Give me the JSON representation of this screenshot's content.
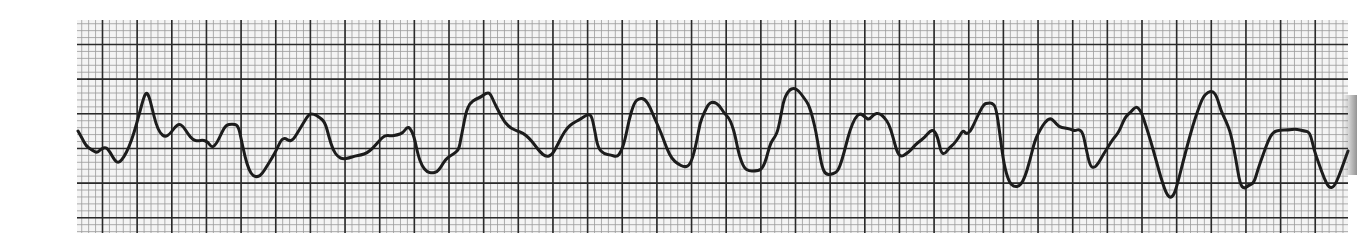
{
  "strip": {
    "description": "ECG rhythm strip on graph paper",
    "background_color": "#ffffff",
    "paper_color": "#f4f4f4",
    "minor_grid_color": "#9a9a9a",
    "major_grid_color": "#2a2a2a",
    "trace_color": "#1c1c1c",
    "grid": {
      "left": 77,
      "top": 20,
      "right": 1348,
      "bottom": 233,
      "minor_spacing": 6.93,
      "major_spacing": 34.65,
      "major_x_origin": 102.5,
      "major_y_origin": 44.5
    }
  },
  "trace": {
    "points": [
      [
        78,
        131
      ],
      [
        82,
        138
      ],
      [
        86,
        146
      ],
      [
        92,
        150
      ],
      [
        97,
        153
      ],
      [
        101,
        149
      ],
      [
        106,
        147
      ],
      [
        110,
        152
      ],
      [
        115,
        161
      ],
      [
        119,
        163
      ],
      [
        124,
        157
      ],
      [
        129,
        147
      ],
      [
        134,
        133
      ],
      [
        139,
        115
      ],
      [
        143,
        100
      ],
      [
        146,
        92
      ],
      [
        149,
        96
      ],
      [
        152,
        108
      ],
      [
        156,
        124
      ],
      [
        160,
        133
      ],
      [
        165,
        137
      ],
      [
        170,
        134
      ],
      [
        175,
        127
      ],
      [
        179,
        124
      ],
      [
        183,
        126
      ],
      [
        188,
        134
      ],
      [
        193,
        140
      ],
      [
        198,
        141
      ],
      [
        203,
        140
      ],
      [
        208,
        142
      ],
      [
        212,
        148
      ],
      [
        217,
        143
      ],
      [
        222,
        132
      ],
      [
        226,
        125
      ],
      [
        232,
        124
      ],
      [
        238,
        125
      ],
      [
        241,
        138
      ],
      [
        245,
        157
      ],
      [
        249,
        170
      ],
      [
        253,
        176
      ],
      [
        258,
        177
      ],
      [
        262,
        174
      ],
      [
        267,
        166
      ],
      [
        272,
        158
      ],
      [
        277,
        149
      ],
      [
        281,
        140
      ],
      [
        285,
        138
      ],
      [
        289,
        141
      ],
      [
        293,
        140
      ],
      [
        298,
        132
      ],
      [
        304,
        122
      ],
      [
        309,
        114
      ],
      [
        314,
        114
      ],
      [
        319,
        117
      ],
      [
        325,
        122
      ],
      [
        329,
        137
      ],
      [
        333,
        150
      ],
      [
        338,
        157
      ],
      [
        343,
        159
      ],
      [
        349,
        158
      ],
      [
        355,
        156
      ],
      [
        361,
        155
      ],
      [
        367,
        153
      ],
      [
        373,
        148
      ],
      [
        379,
        141
      ],
      [
        385,
        135
      ],
      [
        391,
        136
      ],
      [
        397,
        135
      ],
      [
        403,
        133
      ],
      [
        407,
        127
      ],
      [
        410,
        128
      ],
      [
        414,
        136
      ],
      [
        418,
        155
      ],
      [
        422,
        166
      ],
      [
        427,
        172
      ],
      [
        432,
        173
      ],
      [
        437,
        172
      ],
      [
        441,
        167
      ],
      [
        445,
        160
      ],
      [
        450,
        156
      ],
      [
        455,
        153
      ],
      [
        459,
        149
      ],
      [
        461,
        138
      ],
      [
        463,
        128
      ],
      [
        466,
        112
      ],
      [
        470,
        103
      ],
      [
        476,
        99
      ],
      [
        481,
        97
      ],
      [
        486,
        93
      ],
      [
        490,
        93
      ],
      [
        494,
        102
      ],
      [
        499,
        112
      ],
      [
        505,
        123
      ],
      [
        511,
        128
      ],
      [
        517,
        131
      ],
      [
        523,
        133
      ],
      [
        529,
        138
      ],
      [
        534,
        144
      ],
      [
        540,
        152
      ],
      [
        546,
        157
      ],
      [
        552,
        155
      ],
      [
        557,
        146
      ],
      [
        562,
        136
      ],
      [
        567,
        128
      ],
      [
        573,
        123
      ],
      [
        579,
        120
      ],
      [
        585,
        116
      ],
      [
        589,
        114
      ],
      [
        592,
        117
      ],
      [
        595,
        132
      ],
      [
        598,
        148
      ],
      [
        604,
        154
      ],
      [
        611,
        155
      ],
      [
        617,
        157
      ],
      [
        621,
        152
      ],
      [
        625,
        140
      ],
      [
        629,
        120
      ],
      [
        634,
        103
      ],
      [
        639,
        98
      ],
      [
        645,
        99
      ],
      [
        650,
        107
      ],
      [
        654,
        117
      ],
      [
        659,
        128
      ],
      [
        663,
        138
      ],
      [
        667,
        149
      ],
      [
        672,
        159
      ],
      [
        678,
        164
      ],
      [
        684,
        167
      ],
      [
        689,
        166
      ],
      [
        693,
        157
      ],
      [
        697,
        140
      ],
      [
        700,
        123
      ],
      [
        704,
        113
      ],
      [
        709,
        103
      ],
      [
        714,
        102
      ],
      [
        719,
        105
      ],
      [
        724,
        113
      ],
      [
        729,
        118
      ],
      [
        732,
        125
      ],
      [
        735,
        135
      ],
      [
        739,
        155
      ],
      [
        744,
        168
      ],
      [
        749,
        171
      ],
      [
        755,
        171
      ],
      [
        761,
        170
      ],
      [
        765,
        163
      ],
      [
        768,
        152
      ],
      [
        771,
        142
      ],
      [
        775,
        137
      ],
      [
        778,
        130
      ],
      [
        781,
        115
      ],
      [
        784,
        99
      ],
      [
        789,
        90
      ],
      [
        794,
        88
      ],
      [
        799,
        91
      ],
      [
        804,
        98
      ],
      [
        809,
        105
      ],
      [
        813,
        119
      ],
      [
        816,
        132
      ],
      [
        819,
        150
      ],
      [
        822,
        167
      ],
      [
        826,
        175
      ],
      [
        833,
        174
      ],
      [
        838,
        171
      ],
      [
        842,
        160
      ],
      [
        846,
        145
      ],
      [
        850,
        130
      ],
      [
        855,
        118
      ],
      [
        860,
        113
      ],
      [
        865,
        117
      ],
      [
        869,
        120
      ],
      [
        874,
        114
      ],
      [
        879,
        113
      ],
      [
        884,
        117
      ],
      [
        889,
        124
      ],
      [
        893,
        137
      ],
      [
        897,
        152
      ],
      [
        901,
        157
      ],
      [
        906,
        154
      ],
      [
        911,
        150
      ],
      [
        915,
        145
      ],
      [
        920,
        141
      ],
      [
        925,
        137
      ],
      [
        930,
        131
      ],
      [
        934,
        130
      ],
      [
        938,
        138
      ],
      [
        941,
        153
      ],
      [
        945,
        154
      ],
      [
        949,
        148
      ],
      [
        954,
        144
      ],
      [
        959,
        137
      ],
      [
        963,
        130
      ],
      [
        966,
        134
      ],
      [
        970,
        132
      ],
      [
        974,
        124
      ],
      [
        979,
        113
      ],
      [
        984,
        104
      ],
      [
        988,
        103
      ],
      [
        992,
        103
      ],
      [
        996,
        107
      ],
      [
        1000,
        135
      ],
      [
        1004,
        165
      ],
      [
        1009,
        182
      ],
      [
        1014,
        187
      ],
      [
        1020,
        186
      ],
      [
        1025,
        177
      ],
      [
        1030,
        160
      ],
      [
        1035,
        140
      ],
      [
        1040,
        130
      ],
      [
        1045,
        122
      ],
      [
        1050,
        118
      ],
      [
        1054,
        121
      ],
      [
        1059,
        127
      ],
      [
        1065,
        128
      ],
      [
        1070,
        129
      ],
      [
        1075,
        131
      ],
      [
        1079,
        129
      ],
      [
        1083,
        133
      ],
      [
        1086,
        148
      ],
      [
        1090,
        166
      ],
      [
        1094,
        168
      ],
      [
        1098,
        164
      ],
      [
        1103,
        155
      ],
      [
        1108,
        147
      ],
      [
        1113,
        139
      ],
      [
        1119,
        132
      ],
      [
        1125,
        117
      ],
      [
        1131,
        112
      ],
      [
        1136,
        106
      ],
      [
        1141,
        111
      ],
      [
        1146,
        126
      ],
      [
        1151,
        142
      ],
      [
        1156,
        160
      ],
      [
        1161,
        178
      ],
      [
        1166,
        193
      ],
      [
        1170,
        198
      ],
      [
        1174,
        195
      ],
      [
        1178,
        182
      ],
      [
        1183,
        162
      ],
      [
        1188,
        143
      ],
      [
        1193,
        125
      ],
      [
        1198,
        110
      ],
      [
        1203,
        97
      ],
      [
        1208,
        92
      ],
      [
        1213,
        91
      ],
      [
        1217,
        97
      ],
      [
        1221,
        111
      ],
      [
        1226,
        121
      ],
      [
        1231,
        134
      ],
      [
        1236,
        160
      ],
      [
        1240,
        184
      ],
      [
        1244,
        189
      ],
      [
        1249,
        185
      ],
      [
        1254,
        183
      ],
      [
        1258,
        169
      ],
      [
        1263,
        155
      ],
      [
        1268,
        141
      ],
      [
        1273,
        132
      ],
      [
        1280,
        130
      ],
      [
        1288,
        130
      ],
      [
        1296,
        129
      ],
      [
        1304,
        131
      ],
      [
        1310,
        132
      ],
      [
        1314,
        150
      ],
      [
        1319,
        164
      ],
      [
        1324,
        178
      ],
      [
        1329,
        188
      ],
      [
        1334,
        187
      ],
      [
        1339,
        176
      ],
      [
        1344,
        162
      ],
      [
        1348,
        151
      ]
    ]
  }
}
